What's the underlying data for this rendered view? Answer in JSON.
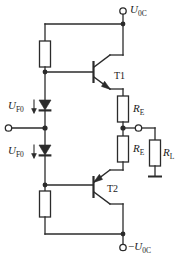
{
  "figure": {
    "kind": "circuit-schematic",
    "background_color": "#ffffff",
    "line_color": "#2b2b2b"
  },
  "terminals": {
    "supply_positive": {
      "label_main": "U",
      "label_sub": "0C",
      "sign": ""
    },
    "supply_negative": {
      "label_main": "U",
      "label_sub": "0C",
      "sign": "−"
    },
    "input": {
      "label": ""
    },
    "output": {
      "label": ""
    }
  },
  "labels": {
    "diode_upper": {
      "main": "U",
      "sub": "F0"
    },
    "diode_lower": {
      "main": "U",
      "sub": "F0"
    },
    "transistor_upper": "T1",
    "transistor_lower": "T2",
    "resistor_emitter_upper": {
      "main": "R",
      "sub": "E"
    },
    "resistor_emitter_lower": {
      "main": "R",
      "sub": "E"
    },
    "resistor_load": {
      "main": "R",
      "sub": "L"
    }
  },
  "components": [
    {
      "name": "bias-resistor-top",
      "type": "resistor",
      "label": ""
    },
    {
      "name": "bias-resistor-bottom",
      "type": "resistor",
      "label": ""
    },
    {
      "name": "diode-upper",
      "type": "diode",
      "orientation": "down"
    },
    {
      "name": "diode-lower",
      "type": "diode",
      "orientation": "down"
    },
    {
      "name": "transistor-t1",
      "type": "npn-bjt",
      "label": "T1"
    },
    {
      "name": "transistor-t2",
      "type": "pnp-bjt",
      "label": "T2"
    },
    {
      "name": "resistor-re-upper",
      "type": "resistor",
      "label": "RE"
    },
    {
      "name": "resistor-re-lower",
      "type": "resistor",
      "label": "RE"
    },
    {
      "name": "resistor-rl",
      "type": "resistor",
      "label": "RL"
    },
    {
      "name": "ground-symbol",
      "type": "ground"
    }
  ]
}
